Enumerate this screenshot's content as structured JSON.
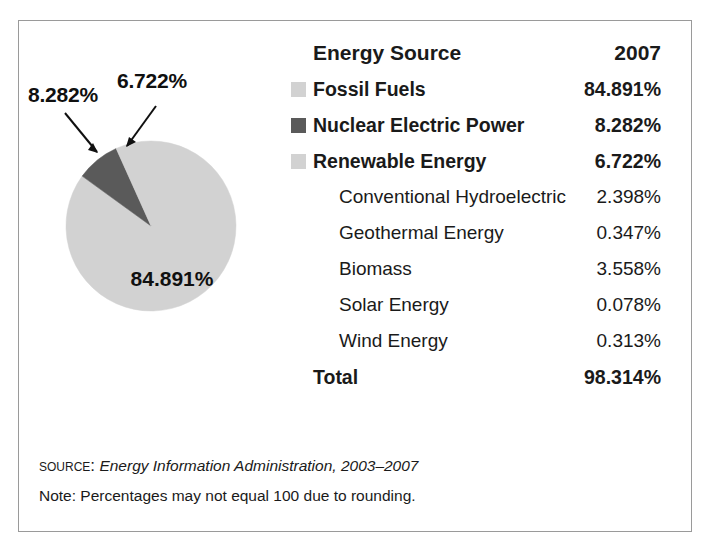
{
  "chart_data": {
    "type": "pie",
    "title": "",
    "categories": [
      "Renewable Energy",
      "Nuclear Electric Power",
      "Fossil Fuels"
    ],
    "values": [
      6.722,
      8.282,
      84.891
    ],
    "value_labels": [
      "6.722%",
      "8.282%",
      "84.891%"
    ],
    "colors": [
      "#d2d2d2",
      "#5a5a5a",
      "#d2d2d2"
    ],
    "start_angle_deg": 90,
    "direction": "counterclockwise",
    "units": "percent",
    "legend_position": "right-table",
    "grid": false,
    "table": {
      "columns": [
        "Energy Source",
        "2007"
      ],
      "rows": [
        {
          "label": "Fossil Fuels",
          "value": "84.891%",
          "level": 0,
          "bold": true,
          "swatch": "#d2d2d2"
        },
        {
          "label": "Nuclear Electric Power",
          "value": "8.282%",
          "level": 0,
          "bold": true,
          "swatch": "#5a5a5a"
        },
        {
          "label": "Renewable Energy",
          "value": "6.722%",
          "level": 0,
          "bold": true,
          "swatch": "#d2d2d2"
        },
        {
          "label": "Conventional Hydroelectric",
          "value": "2.398%",
          "level": 1,
          "bold": false,
          "swatch": null
        },
        {
          "label": "Geothermal Energy",
          "value": "0.347%",
          "level": 1,
          "bold": false,
          "swatch": null
        },
        {
          "label": "Biomass",
          "value": "3.558%",
          "level": 1,
          "bold": false,
          "swatch": null
        },
        {
          "label": "Solar Energy",
          "value": "0.078%",
          "level": 1,
          "bold": false,
          "swatch": null
        },
        {
          "label": "Wind Energy",
          "value": "0.313%",
          "level": 1,
          "bold": false,
          "swatch": null
        },
        {
          "label": "Total",
          "value": "98.314%",
          "level": 0,
          "bold": true,
          "swatch": null
        }
      ]
    }
  },
  "table": {
    "header": {
      "col_source": "Energy Source",
      "col_year": "2007"
    },
    "rows": [
      {
        "label": "Fossil Fuels",
        "value": "84.891%"
      },
      {
        "label": "Nuclear Electric Power",
        "value": "8.282%"
      },
      {
        "label": "Renewable Energy",
        "value": "6.722%"
      },
      {
        "label": "Conventional Hydroelectric",
        "value": "2.398%"
      },
      {
        "label": "Geothermal Energy",
        "value": "0.347%"
      },
      {
        "label": "Biomass",
        "value": "3.558%"
      },
      {
        "label": "Solar Energy",
        "value": "0.078%"
      },
      {
        "label": "Wind Energy",
        "value": "0.313%"
      },
      {
        "label": "Total",
        "value": "98.314%"
      }
    ]
  },
  "pie": {
    "callout_nuclear": "8.282%",
    "callout_renewable": "6.722%",
    "center_label": "84.891%"
  },
  "footnotes": {
    "source_tag": "Source:",
    "source_text": "Energy Information Administration, 2003–2007",
    "note": "Note: Percentages may not equal 100 due to rounding."
  },
  "colors": {
    "light_gray": "#d2d2d2",
    "dark_gray": "#5a5a5a",
    "border": "#9a9a9a",
    "text": "#1a1a1a"
  }
}
